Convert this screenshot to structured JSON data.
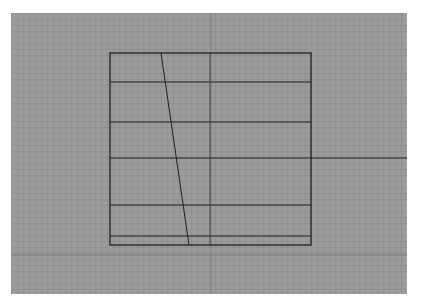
{
  "canvas": {
    "background": "#9b9b9b",
    "axis_color": "#7e7e7e",
    "line_color": "#1e1e1e",
    "origin": {
      "x": 11,
      "y": 13
    },
    "size": {
      "width": 396,
      "height": 281
    }
  },
  "drawing": {
    "rectangle": {
      "x1": 110,
      "y1": 53,
      "x2": 311,
      "y2": 245
    },
    "horizontal_lines_y": [
      82,
      122,
      158,
      205,
      236
    ],
    "extended_line": {
      "y": 158,
      "x_end": 407
    },
    "center_divider_x": 210,
    "slanted_line": {
      "x1": 161,
      "y1": 53,
      "x2": 189,
      "y2": 245
    },
    "axes": {
      "vertical_x": 211,
      "horizontal_y": 255
    }
  }
}
